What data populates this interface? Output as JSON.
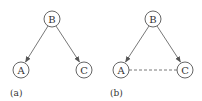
{
  "panels": [
    {
      "label": "(a)",
      "nodes": [
        {
          "id": "B",
          "label": "B",
          "cx": 52,
          "cy": 19
        },
        {
          "id": "A",
          "label": "A",
          "cx": 21,
          "cy": 70
        },
        {
          "id": "C",
          "label": "C",
          "cx": 84,
          "cy": 70
        }
      ],
      "edges": [
        {
          "from": "B",
          "to": "A",
          "style": "arrow"
        },
        {
          "from": "B",
          "to": "C",
          "style": "arrow"
        }
      ]
    },
    {
      "label": "(b)",
      "nodes": [
        {
          "id": "B",
          "label": "B",
          "cx": 153,
          "cy": 19
        },
        {
          "id": "A",
          "label": "A",
          "cx": 121,
          "cy": 70
        },
        {
          "id": "C",
          "label": "C",
          "cx": 185,
          "cy": 70
        }
      ],
      "edges": [
        {
          "from": "B",
          "to": "A",
          "style": "arrow"
        },
        {
          "from": "B",
          "to": "C",
          "style": "arrow"
        },
        {
          "from": "A",
          "to": "C",
          "style": "dashed"
        }
      ]
    }
  ],
  "node_radius": 8,
  "colors": {
    "stroke": "#555555",
    "text": "#333333",
    "background": "#ffffff"
  }
}
